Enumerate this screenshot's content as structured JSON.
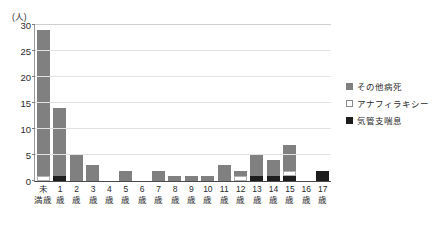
{
  "chart_data": {
    "type": "bar",
    "stacked": true,
    "title": "",
    "subtitle": "",
    "xlabel": "",
    "ylabel": "(人)",
    "y_unit_label": "(人)",
    "ylim": [
      0,
      30
    ],
    "yticks": [
      0,
      5,
      10,
      15,
      20,
      25,
      30
    ],
    "ytick_labels": [
      "0",
      "5",
      "10",
      "15",
      "20",
      "25",
      "30"
    ],
    "grid": true,
    "legend_position": "right",
    "categories": [
      "未満歳",
      "1歳",
      "2歳",
      "3歳",
      "4歳",
      "5歳",
      "6歳",
      "7歳",
      "8歳",
      "9歳",
      "10歳",
      "11歳",
      "12歳",
      "13歳",
      "14歳",
      "15歳",
      "16歳",
      "17歳"
    ],
    "category_lines": [
      {
        "line1": "未",
        "line2": "満歳"
      },
      {
        "line1": "1",
        "line2": "歳"
      },
      {
        "line1": "2",
        "line2": "歳"
      },
      {
        "line1": "3",
        "line2": "歳"
      },
      {
        "line1": "4",
        "line2": "歳"
      },
      {
        "line1": "5",
        "line2": "歳"
      },
      {
        "line1": "6",
        "line2": "歳"
      },
      {
        "line1": "7",
        "line2": "歳"
      },
      {
        "line1": "8",
        "line2": "歳"
      },
      {
        "line1": "9",
        "line2": "歳"
      },
      {
        "line1": "10",
        "line2": "歳"
      },
      {
        "line1": "11",
        "line2": "歳"
      },
      {
        "line1": "12",
        "line2": "歳"
      },
      {
        "line1": "13",
        "line2": "歳"
      },
      {
        "line1": "14",
        "line2": "歳"
      },
      {
        "line1": "15",
        "line2": "歳"
      },
      {
        "line1": "16",
        "line2": "歳"
      },
      {
        "line1": "17",
        "line2": "歳"
      }
    ],
    "series": [
      {
        "name": "気管支喘息",
        "color": "#1d1d1d",
        "values": [
          0,
          1,
          0,
          0,
          0,
          0,
          0,
          0,
          0,
          0,
          0,
          0,
          0,
          1,
          1,
          1,
          0,
          2
        ]
      },
      {
        "name": "アナフィラキシー",
        "color": "#ffffff",
        "values": [
          1,
          0,
          0,
          0,
          0,
          0,
          0,
          0,
          0,
          0,
          0,
          0,
          1,
          0,
          0,
          1,
          0,
          0
        ]
      },
      {
        "name": "その他病死",
        "color": "#808080",
        "values": [
          28,
          13,
          5,
          3,
          0,
          2,
          0,
          2,
          1,
          1,
          1,
          3,
          1,
          4,
          3,
          5,
          0,
          0
        ]
      }
    ],
    "totals": [
      29,
      14,
      5,
      3,
      0,
      2,
      0,
      2,
      1,
      1,
      1,
      3,
      2,
      5,
      4,
      7,
      0,
      2
    ]
  },
  "legend": {
    "items": [
      {
        "label": "その他病死",
        "color": "#808080"
      },
      {
        "label": "アナフィラキシー",
        "color": "#ffffff"
      },
      {
        "label": "気管支喘息",
        "color": "#1d1d1d"
      }
    ]
  }
}
